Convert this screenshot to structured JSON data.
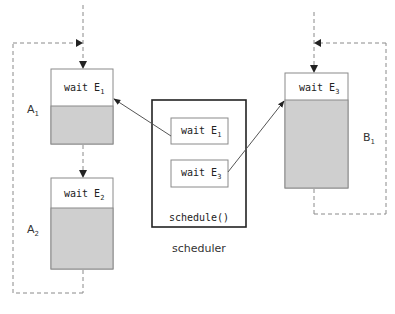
{
  "diagram": {
    "colors": {
      "task_fill": "#cfcfcf",
      "task_border": "#888888",
      "dashed": "#888888",
      "scheduler_border": "#222222",
      "arrow": "#555555"
    },
    "tasks": [
      {
        "id": "A1",
        "label": "A",
        "label_sub": "1",
        "header_text": "wait E",
        "header_sub": "1"
      },
      {
        "id": "A2",
        "label": "A",
        "label_sub": "2",
        "header_text": "wait E",
        "header_sub": "2"
      },
      {
        "id": "B1",
        "label": "B",
        "label_sub": "1",
        "header_text": "wait E",
        "header_sub": "3"
      }
    ],
    "scheduler": {
      "caption": "scheduler",
      "function_label": "schedule()",
      "queue": [
        {
          "text": "wait E",
          "sub": "1"
        },
        {
          "text": "wait E",
          "sub": "3"
        }
      ]
    },
    "edges": [
      {
        "from": "scheduler.queue.0",
        "to": "A1",
        "style": "solid"
      },
      {
        "from": "scheduler.queue.1",
        "to": "B1",
        "style": "solid"
      },
      {
        "from": "A1",
        "to": "A2",
        "style": "dashed"
      },
      {
        "from": "A2",
        "to": "A1",
        "style": "dashed-loop"
      },
      {
        "from": "B1",
        "to": "B1",
        "style": "dashed-loop"
      }
    ]
  }
}
